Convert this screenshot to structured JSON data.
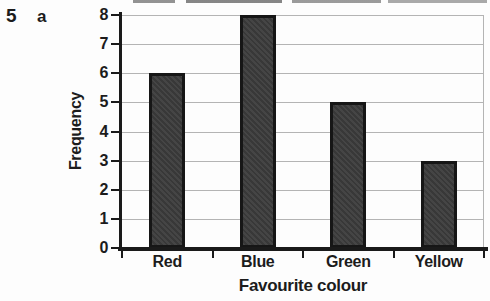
{
  "question": {
    "number": "5",
    "part": "a"
  },
  "chart_data": {
    "type": "bar",
    "categories": [
      "Red",
      "Blue",
      "Green",
      "Yellow"
    ],
    "values": [
      6,
      8,
      5,
      3
    ],
    "title": "",
    "xlabel": "Favourite colour",
    "ylabel": "Frequency",
    "ylim": [
      0,
      8
    ],
    "ytick_step": 1,
    "grid": "horizontal",
    "legend": "none",
    "bar_color": "#3b3b3b",
    "bar_border_color": "#161616",
    "axis_color": "#1a1a1a",
    "gridline_color": "#b4b4b4",
    "text_color": "#1c1c1c"
  }
}
